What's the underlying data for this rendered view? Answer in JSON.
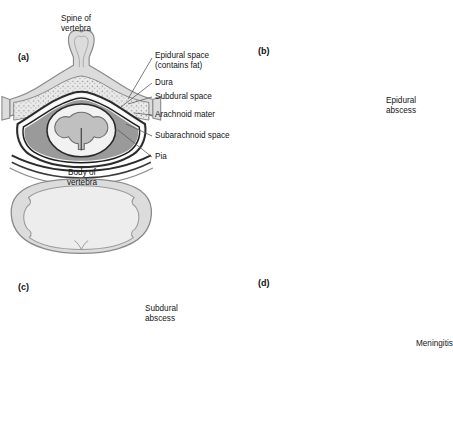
{
  "figure": {
    "title_label": "Spine of vertebra",
    "background": "#ffffff",
    "panels": [
      {
        "id": "a",
        "letter": "(a)",
        "kind": "normal-anatomy",
        "labels": [
          {
            "name": "spine-of-vertebra",
            "text": "Spine of\nvertebra"
          },
          {
            "name": "epidural-space",
            "text": "Epidural space\n(contains fat)"
          },
          {
            "name": "dura",
            "text": "Dura"
          },
          {
            "name": "subdural-space",
            "text": "Subdural space"
          },
          {
            "name": "arachnoid-mater",
            "text": "Arachnoid mater"
          },
          {
            "name": "subarachnoid-space",
            "text": "Subarachnoid space"
          },
          {
            "name": "pia",
            "text": "Pia"
          },
          {
            "name": "body-of-vertebra",
            "text": "Body of\nvertebra"
          }
        ]
      },
      {
        "id": "b",
        "letter": "(b)",
        "kind": "epidural-abscess",
        "labels": [
          {
            "name": "epidural-abscess",
            "text": "Epidural\nabscess"
          }
        ]
      },
      {
        "id": "c",
        "letter": "(c)",
        "kind": "subdural-abscess",
        "labels": [
          {
            "name": "subdural-abscess",
            "text": "Subdural\nabscess"
          }
        ]
      },
      {
        "id": "d",
        "letter": "(d)",
        "kind": "meningitis",
        "labels": [
          {
            "name": "meningitis",
            "text": "Meningitis"
          }
        ]
      }
    ],
    "colors": {
      "bone_fill": "#dcdcdc",
      "bone_edge": "#8a8a8a",
      "cord_white_matter": "#f2f2f2",
      "cord_gray_matter": "#c0c0c0",
      "epidural_fat": "#e8e8e8",
      "subarachnoid": "#9a9a9a",
      "dura_line": "#2b2b2b",
      "abscess": "#0c0c0c",
      "leader_line": "#5a5a5a",
      "text": "#141414"
    }
  }
}
